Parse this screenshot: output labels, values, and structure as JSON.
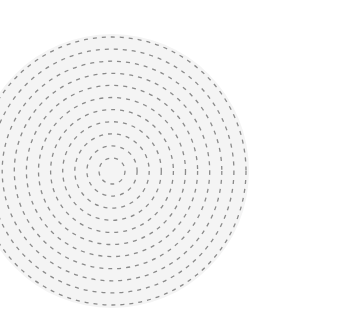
{
  "figure": {
    "shape": "concentric-dashed-circles",
    "center": [
      112,
      171
    ],
    "ring_count": 11,
    "ring_spacing": 12.1,
    "outer_radius": 134,
    "stroke_color": "#8a8a8a",
    "fill_color": "#f4f4f4",
    "background": "#ffffff"
  }
}
